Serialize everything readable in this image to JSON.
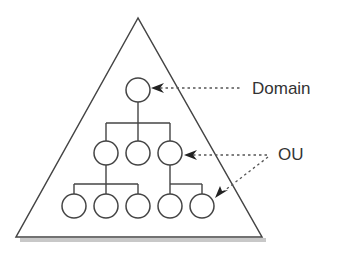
{
  "diagram": {
    "labels": {
      "domain": "Domain",
      "ou": "OU"
    },
    "colors": {
      "stroke": "#444444",
      "shadow": "#bbbbbb",
      "text": "#333333",
      "background": "#ffffff"
    },
    "triangle": {
      "apex": [
        138,
        18
      ],
      "left": [
        16,
        237
      ],
      "right": [
        262,
        237
      ]
    },
    "nodes": {
      "root": {
        "cx": 138,
        "cy": 90
      },
      "level1": [
        {
          "cx": 106,
          "cy": 153
        },
        {
          "cx": 138,
          "cy": 153
        },
        {
          "cx": 170,
          "cy": 153
        }
      ],
      "level2": [
        {
          "cx": 74,
          "cy": 206
        },
        {
          "cx": 106,
          "cy": 206
        },
        {
          "cx": 138,
          "cy": 206
        },
        {
          "cx": 170,
          "cy": 206
        },
        {
          "cx": 202,
          "cy": 206
        }
      ],
      "radius": 12
    },
    "callouts": [
      {
        "label": "Domain",
        "points_to": "root"
      },
      {
        "label": "OU",
        "points_to": [
          "level1[2]",
          "level2[4]"
        ]
      }
    ]
  }
}
